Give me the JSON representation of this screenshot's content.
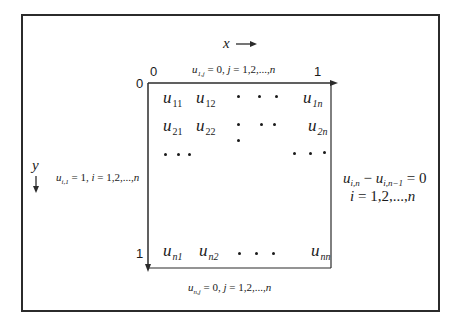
{
  "diagram": {
    "axes": {
      "x_label": "x",
      "y_label": "y",
      "x_arrow": "→",
      "y_arrow": "↓"
    },
    "ticks": {
      "top_left_x": "0",
      "top_left_y": "0",
      "top_right_x": "1",
      "bottom_left_y": "1"
    },
    "boundary_conditions": {
      "top": {
        "lhs": "u",
        "sub": "1,j",
        "rhs": " = 0,  ",
        "var": "j",
        "range": " = 1,2,...,",
        "n": "n"
      },
      "left": {
        "lhs": "u",
        "sub": "i,1",
        "rhs": " = 1, ",
        "var": "i",
        "range": " = 1,2,...,",
        "n": "n"
      },
      "bottom": {
        "lhs": "u",
        "sub": "n,j",
        "rhs": " = 0, ",
        "var": "j",
        "range": " = 1,2,...,",
        "n": "n"
      },
      "right": {
        "line1": {
          "u1": "u",
          "sub1": "i,n",
          "minus": " − ",
          "u2": "u",
          "sub2": "i,n−1",
          "rhs": " = 0"
        },
        "line2": {
          "var": "i",
          "range": " = 1,2,...,",
          "n": "n"
        }
      }
    },
    "grid_cells": [
      {
        "u": "u",
        "sub": "11"
      },
      {
        "u": "u",
        "sub": "12"
      },
      {
        "u": "u",
        "sub": "1n"
      },
      {
        "u": "u",
        "sub": "21"
      },
      {
        "u": "u",
        "sub": "22"
      },
      {
        "u": "u",
        "sub": "2n"
      },
      {
        "u": "u",
        "sub": "n1"
      },
      {
        "u": "u",
        "sub": "n2"
      },
      {
        "u": "u",
        "sub": "nn"
      }
    ],
    "colors": {
      "line": "#2b2b2b",
      "text": "#1a1a1a",
      "background": "#ffffff"
    }
  }
}
